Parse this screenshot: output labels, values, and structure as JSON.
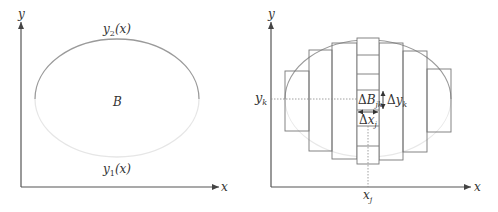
{
  "colors": {
    "axis": "#555555",
    "curve_upper": "#9a9a9a",
    "curve_lower": "#e6e6e6",
    "rect_stroke": "#777777",
    "text": "#333333"
  },
  "left_panel": {
    "x_axis_label": "x",
    "y_axis_label": "y",
    "upper_curve_label": "y",
    "upper_curve_sub": "2",
    "upper_curve_arg": "(x)",
    "lower_curve_label": "y",
    "lower_curve_sub": "1",
    "lower_curve_arg": "(x)",
    "region_label": "B"
  },
  "right_panel": {
    "x_axis_label": "x",
    "y_axis_label": "y",
    "yk_label": "y",
    "yk_sub": "k",
    "xj_label": "x",
    "xj_sub": "j",
    "cell_label_delta": "Δ",
    "cell_label": "B",
    "cell_sub": "jk",
    "dx_delta": "Δ",
    "dx_label": "x",
    "dx_sub": "j",
    "dy_delta": "Δ",
    "dy_label": "y",
    "dy_sub": "k"
  }
}
